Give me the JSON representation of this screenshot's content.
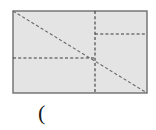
{
  "figure": {
    "kind": "geometry-diagram",
    "background_color": "#ffffff",
    "rectangle": {
      "label": "rectangle",
      "fill_color": "#e4e4e4",
      "stroke_color": "#6e6e6e",
      "stroke_width": 1.4,
      "x": 13,
      "y": 11,
      "width": 134,
      "height": 82
    },
    "diagonal": {
      "label": "diagonal",
      "style": "dashed",
      "color": "#6a6a6a",
      "x1": 13,
      "y1": 11,
      "x2": 147,
      "y2": 93
    },
    "vertical_divider": {
      "label": "vertical-divider",
      "style": "dashed",
      "color": "#3b3b3b",
      "x": 95,
      "y1": 11,
      "y2": 93
    },
    "left_horizontal": {
      "label": "left-horizontal-divider",
      "style": "dashed",
      "color": "#3b3b3b",
      "y": 58,
      "x1": 13,
      "x2": 95
    },
    "right_horizontal": {
      "label": "right-horizontal-divider",
      "style": "dashed",
      "color": "#3b3b3b",
      "y": 34,
      "x1": 95,
      "x2": 147
    },
    "intersection_point": {
      "label": "intersection",
      "x": 95,
      "y": 58
    }
  },
  "caption": {
    "text": "(",
    "color": "#1a1a1a"
  }
}
